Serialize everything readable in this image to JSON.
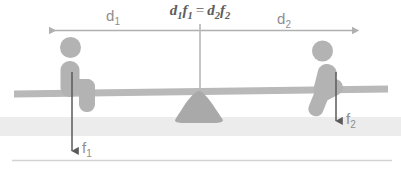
{
  "diagram": {
    "equation": {
      "d1": "d",
      "d1_sub": "1",
      "f1": "f",
      "f1_sub": "1",
      "operator": "=",
      "d2": "d",
      "d2_sub": "2",
      "f2": "f",
      "f2_sub": "2",
      "full_text": "d1f1 = d2f2"
    },
    "labels": {
      "distance_left": "d",
      "distance_left_sub": "1",
      "distance_right": "d",
      "distance_right_sub": "2",
      "force_left": "f",
      "force_left_sub": "1",
      "force_right": "f",
      "force_right_sub": "2"
    },
    "colors": {
      "figure_gray": "#b3b3b3",
      "plank_gray": "#b9b9b9",
      "fulcrum_gray": "#a9a9a9",
      "ground_band": "#ececec",
      "dimension_line": "#b0b0b0",
      "force_arrow": "#5a5a5a",
      "label_text": "#8e8e8e",
      "equation_text": "#5d5d5d",
      "baseline_rule": "#d2d2d2",
      "background": "#ffffff"
    },
    "elements": {
      "left_person": "person sitting on left end of plank",
      "right_person": "person sitting on right end of plank",
      "fulcrum": "triangular pivot mound at center",
      "plank": "horizontal lever beam",
      "ground": "light horizontal ground band",
      "baseline": "thin horizontal rule at bottom"
    }
  }
}
